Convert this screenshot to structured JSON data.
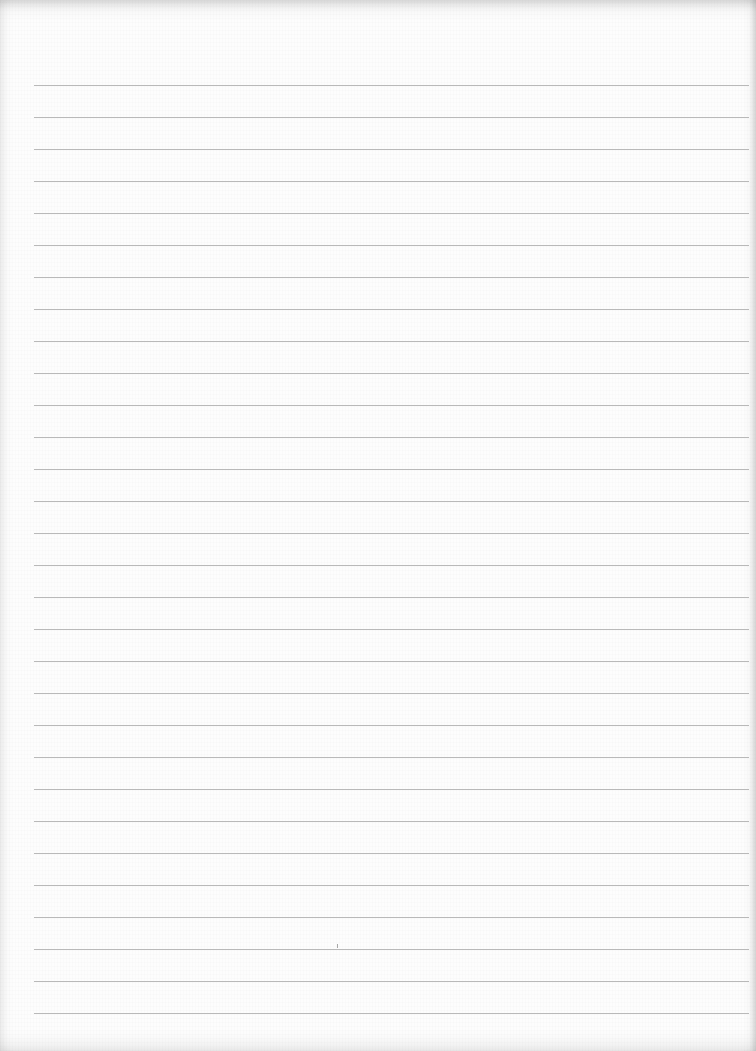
{
  "sheet": {
    "type": "lined-paper",
    "paper_color": "#fdfdfd",
    "line_color": "#b9b9b9",
    "ruled_lines": {
      "count": 30,
      "first_y": 85,
      "spacing": 32,
      "x_start": 34,
      "x_end": 749
    },
    "marks": [
      {
        "x": 337,
        "y": 944
      }
    ]
  }
}
